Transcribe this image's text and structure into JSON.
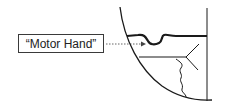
{
  "label": {
    "text": "“Motor Hand”"
  },
  "colors": {
    "stroke": "#1a1a1a",
    "box_border": "#3a3a3a",
    "arrow": "#666666",
    "background": "#ffffff"
  },
  "icons": {
    "arrow": "dotted-arrow-right"
  }
}
